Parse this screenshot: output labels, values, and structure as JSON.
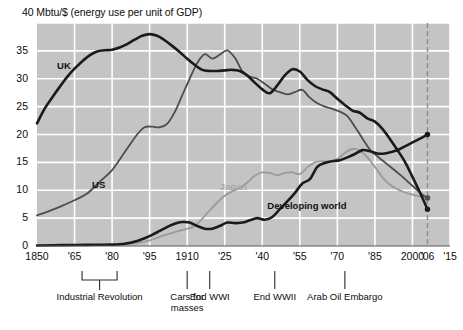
{
  "chart_data": {
    "type": "line",
    "title": "40 Mbtu/$ (energy use per unit of GDP)",
    "ylabel": "Mbtu/$",
    "xlabel": "",
    "ylim": [
      0,
      40
    ],
    "xlim": [
      1850,
      2015
    ],
    "grid": true,
    "legend": "inline-labels",
    "y_ticks": [
      "0",
      "5",
      "10",
      "15",
      "20",
      "25",
      "30",
      "35",
      "40"
    ],
    "y_tick_values": [
      0,
      5,
      10,
      15,
      20,
      25,
      30,
      35,
      40
    ],
    "x_ticks": [
      "1850",
      "'65",
      "'80",
      "'95",
      "1910",
      "'25",
      "'40",
      "'55",
      "'70",
      "'85",
      "2000",
      "'06",
      "'15"
    ],
    "x_tick_values": [
      1850,
      1865,
      1880,
      1895,
      1910,
      1925,
      1940,
      1955,
      1970,
      1985,
      2000,
      2006,
      2015
    ],
    "marker_year": 2006,
    "series": [
      {
        "name": "UK",
        "color": "#1a1a1a",
        "width": 2.6,
        "label_x": 1858,
        "label_y": 32.2,
        "points": [
          [
            1850,
            22.0
          ],
          [
            1853,
            24.6
          ],
          [
            1856,
            26.6
          ],
          [
            1859,
            28.5
          ],
          [
            1862,
            30.3
          ],
          [
            1865,
            31.8
          ],
          [
            1868,
            33.1
          ],
          [
            1871,
            34.2
          ],
          [
            1874,
            34.9
          ],
          [
            1877,
            35.1
          ],
          [
            1880,
            35.2
          ],
          [
            1883,
            35.6
          ],
          [
            1886,
            36.2
          ],
          [
            1889,
            37.0
          ],
          [
            1892,
            37.7
          ],
          [
            1895,
            38.0
          ],
          [
            1898,
            37.7
          ],
          [
            1901,
            36.9
          ],
          [
            1904,
            35.9
          ],
          [
            1907,
            34.8
          ],
          [
            1910,
            33.6
          ],
          [
            1913,
            32.5
          ],
          [
            1916,
            31.6
          ],
          [
            1919,
            31.4
          ],
          [
            1922,
            31.4
          ],
          [
            1925,
            31.5
          ],
          [
            1928,
            31.6
          ],
          [
            1931,
            31.4
          ],
          [
            1934,
            30.6
          ],
          [
            1937,
            29.3
          ],
          [
            1940,
            28.1
          ],
          [
            1943,
            27.4
          ],
          [
            1946,
            28.8
          ],
          [
            1949,
            30.6
          ],
          [
            1952,
            31.7
          ],
          [
            1955,
            31.3
          ],
          [
            1958,
            29.8
          ],
          [
            1961,
            28.7
          ],
          [
            1964,
            28.1
          ],
          [
            1967,
            27.6
          ],
          [
            1970,
            26.4
          ],
          [
            1973,
            25.3
          ],
          [
            1976,
            24.3
          ],
          [
            1979,
            23.9
          ],
          [
            1982,
            22.9
          ],
          [
            1985,
            22.3
          ],
          [
            1988,
            21.0
          ],
          [
            1991,
            19.2
          ],
          [
            1994,
            17.2
          ],
          [
            1997,
            15.1
          ],
          [
            2000,
            12.4
          ],
          [
            2003,
            9.6
          ],
          [
            2006,
            6.6
          ]
        ],
        "endpoint": [
          2006,
          6.6
        ]
      },
      {
        "name": "US",
        "color": "#4d4d4d",
        "width": 1.8,
        "label_x": 1872,
        "label_y": 11.0,
        "points": [
          [
            1850,
            5.5
          ],
          [
            1855,
            6.3
          ],
          [
            1860,
            7.2
          ],
          [
            1865,
            8.2
          ],
          [
            1870,
            9.4
          ],
          [
            1875,
            11.5
          ],
          [
            1880,
            13.6
          ],
          [
            1885,
            16.8
          ],
          [
            1890,
            20.0
          ],
          [
            1893,
            21.3
          ],
          [
            1896,
            21.4
          ],
          [
            1899,
            21.3
          ],
          [
            1902,
            21.9
          ],
          [
            1905,
            24.0
          ],
          [
            1908,
            27.0
          ],
          [
            1911,
            30.0
          ],
          [
            1914,
            32.8
          ],
          [
            1917,
            34.4
          ],
          [
            1920,
            33.6
          ],
          [
            1923,
            34.3
          ],
          [
            1926,
            35.1
          ],
          [
            1929,
            33.8
          ],
          [
            1932,
            31.4
          ],
          [
            1935,
            30.4
          ],
          [
            1938,
            30.0
          ],
          [
            1941,
            29.1
          ],
          [
            1944,
            28.1
          ],
          [
            1947,
            27.6
          ],
          [
            1950,
            27.2
          ],
          [
            1953,
            27.6
          ],
          [
            1956,
            28.0
          ],
          [
            1959,
            26.6
          ],
          [
            1962,
            25.6
          ],
          [
            1965,
            25.0
          ],
          [
            1968,
            24.6
          ],
          [
            1971,
            24.1
          ],
          [
            1974,
            23.3
          ],
          [
            1977,
            21.4
          ],
          [
            1980,
            19.3
          ],
          [
            1983,
            17.3
          ],
          [
            1986,
            16.1
          ],
          [
            1989,
            15.0
          ],
          [
            1992,
            13.9
          ],
          [
            1995,
            12.8
          ],
          [
            1998,
            11.6
          ],
          [
            2001,
            10.4
          ],
          [
            2004,
            9.2
          ],
          [
            2006,
            8.6
          ]
        ],
        "endpoint": [
          2006,
          8.6
        ]
      },
      {
        "name": "Japan",
        "color": "#9a9a9a",
        "width": 1.8,
        "label_x": 1923,
        "label_y": 10.6,
        "points": [
          [
            1880,
            0.2
          ],
          [
            1885,
            0.3
          ],
          [
            1890,
            0.5
          ],
          [
            1895,
            1.0
          ],
          [
            1900,
            1.8
          ],
          [
            1905,
            2.5
          ],
          [
            1910,
            3.1
          ],
          [
            1913,
            3.6
          ],
          [
            1916,
            4.9
          ],
          [
            1919,
            6.4
          ],
          [
            1922,
            7.8
          ],
          [
            1925,
            9.0
          ],
          [
            1928,
            9.8
          ],
          [
            1931,
            10.4
          ],
          [
            1934,
            11.4
          ],
          [
            1937,
            12.6
          ],
          [
            1940,
            13.2
          ],
          [
            1943,
            13.1
          ],
          [
            1946,
            12.7
          ],
          [
            1949,
            13.1
          ],
          [
            1952,
            13.2
          ],
          [
            1955,
            12.9
          ],
          [
            1958,
            14.1
          ],
          [
            1961,
            15.0
          ],
          [
            1964,
            15.2
          ],
          [
            1967,
            15.2
          ],
          [
            1970,
            15.6
          ],
          [
            1973,
            16.7
          ],
          [
            1976,
            17.4
          ],
          [
            1979,
            17.1
          ],
          [
            1982,
            15.9
          ],
          [
            1985,
            14.2
          ],
          [
            1988,
            12.3
          ],
          [
            1991,
            11.0
          ],
          [
            1994,
            10.2
          ],
          [
            1997,
            9.6
          ],
          [
            2000,
            9.2
          ],
          [
            2003,
            8.9
          ],
          [
            2006,
            8.7
          ]
        ],
        "endpoint": [
          2006,
          8.7
        ]
      },
      {
        "name": "Developing world",
        "color": "#1a1a1a",
        "width": 2.6,
        "label_x": 1942,
        "label_y": 7.2,
        "points": [
          [
            1850,
            0.1
          ],
          [
            1860,
            0.15
          ],
          [
            1870,
            0.2
          ],
          [
            1880,
            0.25
          ],
          [
            1885,
            0.4
          ],
          [
            1890,
            0.9
          ],
          [
            1893,
            1.4
          ],
          [
            1896,
            2.0
          ],
          [
            1899,
            2.7
          ],
          [
            1902,
            3.4
          ],
          [
            1905,
            4.0
          ],
          [
            1908,
            4.3
          ],
          [
            1911,
            4.2
          ],
          [
            1914,
            3.6
          ],
          [
            1917,
            3.1
          ],
          [
            1920,
            3.1
          ],
          [
            1923,
            3.6
          ],
          [
            1926,
            4.2
          ],
          [
            1929,
            4.1
          ],
          [
            1932,
            4.2
          ],
          [
            1935,
            4.6
          ],
          [
            1938,
            5.0
          ],
          [
            1941,
            4.7
          ],
          [
            1944,
            5.2
          ],
          [
            1947,
            6.6
          ],
          [
            1950,
            8.0
          ],
          [
            1953,
            9.5
          ],
          [
            1956,
            11.2
          ],
          [
            1959,
            12.0
          ],
          [
            1962,
            14.2
          ],
          [
            1965,
            14.9
          ],
          [
            1968,
            15.2
          ],
          [
            1971,
            15.4
          ],
          [
            1974,
            15.9
          ],
          [
            1977,
            16.5
          ],
          [
            1980,
            17.2
          ],
          [
            1983,
            17.0
          ],
          [
            1986,
            16.6
          ],
          [
            1989,
            16.6
          ],
          [
            1992,
            16.9
          ],
          [
            1995,
            17.4
          ],
          [
            1998,
            18.1
          ],
          [
            2001,
            18.8
          ],
          [
            2004,
            19.5
          ],
          [
            2006,
            20.0
          ]
        ],
        "endpoint": [
          2006,
          20.0
        ]
      }
    ],
    "annotations": [
      {
        "label": "Industrial Revolution",
        "type": "range",
        "start": 1868,
        "end": 1882,
        "mid": 1875
      },
      {
        "label": "Cars for\nmasses",
        "type": "tick",
        "year": 1910
      },
      {
        "label": "End WWI",
        "type": "tick",
        "year": 1919
      },
      {
        "label": "End WWII",
        "type": "tick",
        "year": 1945
      },
      {
        "label": "Arab Oil Embargo",
        "type": "tick",
        "year": 1973
      }
    ]
  },
  "style": {
    "plot_bg": "#c4c4c4",
    "grid_color": "#ffffff",
    "axis_text": "#0d0d0d",
    "marker_line": "#8a8a8a"
  }
}
